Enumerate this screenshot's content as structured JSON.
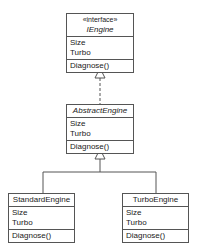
{
  "classes": {
    "iengine": {
      "stereotype": "«interface»",
      "name": "IEngine",
      "attributes": [
        "Size",
        "Turbo"
      ],
      "operations": [
        "Diagnose()"
      ]
    },
    "abstract": {
      "name": "AbstractEngine",
      "attributes": [
        "Size",
        "Turbo"
      ],
      "operations": [
        "Diagnose()"
      ]
    },
    "standard": {
      "name": "StandardEngine",
      "attributes": [
        "Size",
        "Turbo"
      ],
      "operations": [
        "Diagnose()"
      ]
    },
    "turbo": {
      "name": "TurboEngine",
      "attributes": [
        "Size",
        "Turbo"
      ],
      "operations": [
        "Diagnose()"
      ]
    }
  },
  "relations": [
    {
      "from": "AbstractEngine",
      "to": "IEngine",
      "type": "realization"
    },
    {
      "from": "StandardEngine",
      "to": "AbstractEngine",
      "type": "generalization"
    },
    {
      "from": "TurboEngine",
      "to": "AbstractEngine",
      "type": "generalization"
    }
  ]
}
